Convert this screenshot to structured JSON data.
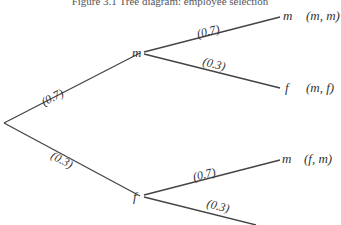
{
  "caption": "Figure 3.1  Tree diagram: employee selection",
  "tree": {
    "root": {
      "x": 4,
      "y": 123
    },
    "first_level": [
      {
        "id": "n_m",
        "label": "m",
        "x": 143,
        "y": 53,
        "branch_prob": "(0.7)"
      },
      {
        "id": "n_f",
        "label": "f",
        "x": 143,
        "y": 196,
        "branch_prob": "(0.3)"
      }
    ],
    "leaves": [
      {
        "parent": "n_m",
        "label": "m",
        "prob": "(0.7)",
        "outcome": "(m, m)"
      },
      {
        "parent": "n_m",
        "label": "f",
        "prob": "(0.3)",
        "outcome": "(m, f)"
      },
      {
        "parent": "n_f",
        "label": "m",
        "prob": "(0.7)",
        "outcome": "(f, m)"
      },
      {
        "parent": "n_f",
        "label": "",
        "prob": "(0.3)",
        "outcome": ""
      }
    ]
  },
  "colors": {
    "line": "#444444",
    "text": "#333333",
    "background": "#ffffff"
  }
}
